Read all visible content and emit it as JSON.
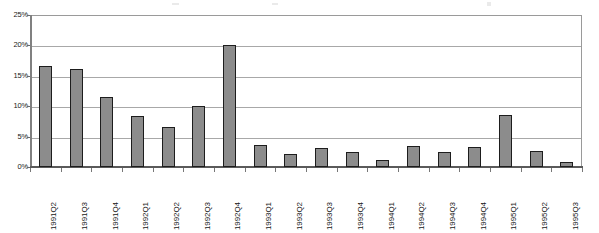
{
  "chart_data": {
    "type": "bar",
    "title": "",
    "subtitle": "",
    "xlabel": "",
    "ylabel": "",
    "ylim": [
      0,
      25
    ],
    "ytick_labels": [
      "0%",
      "5%",
      "10%",
      "15%",
      "20%",
      "25%"
    ],
    "ytick_values": [
      0,
      5,
      10,
      15,
      20,
      25
    ],
    "grid": true,
    "legend": false,
    "legend_position": "none",
    "categories": [
      "1991Q2",
      "1991Q3",
      "1991Q4",
      "1992Q1",
      "1992Q2",
      "1992Q3",
      "1992Q4",
      "1993Q1",
      "1993Q2",
      "1993Q3",
      "1993Q4",
      "1994Q1",
      "1994Q2",
      "1994Q3",
      "1994Q4",
      "1995Q1",
      "1995Q2",
      "1995Q3"
    ],
    "values": [
      16.6,
      16.1,
      11.5,
      8.4,
      6.6,
      10.0,
      20.0,
      3.7,
      2.1,
      3.1,
      2.4,
      1.2,
      3.5,
      2.4,
      3.3,
      8.5,
      2.6,
      0.8
    ],
    "series": [
      {
        "name": "",
        "values": [
          16.6,
          16.1,
          11.5,
          8.4,
          6.6,
          10.0,
          20.0,
          3.7,
          2.1,
          3.1,
          2.4,
          1.2,
          3.5,
          2.4,
          3.3,
          8.5,
          2.6,
          0.8
        ]
      }
    ],
    "colors": {
      "bar_fill": "#8c8c8c",
      "bar_border": "#1d1d1d",
      "gridline": "#a8a8a8",
      "axis": "#6a6a6a",
      "plot_background": "#ffffff",
      "text": "#161616"
    }
  }
}
